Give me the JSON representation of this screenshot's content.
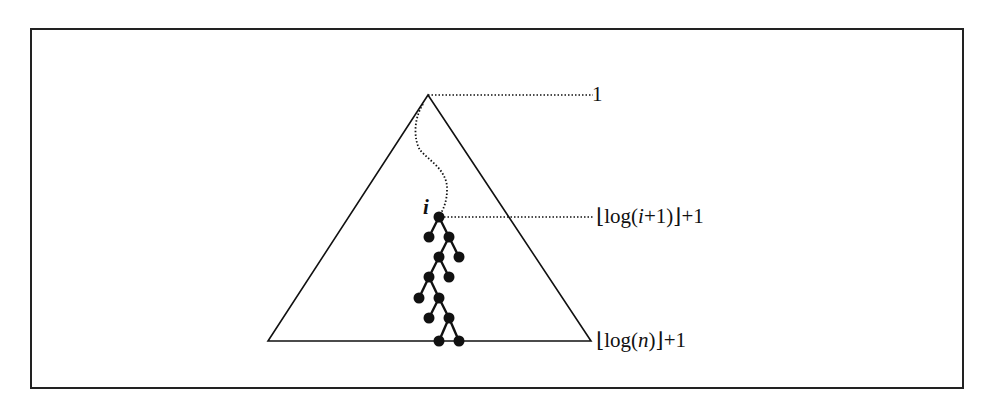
{
  "diagram": {
    "type": "binary-tree-depth-illustration",
    "frame": {
      "x": 30,
      "y": 28,
      "w": 934,
      "h": 361
    },
    "triangle": {
      "apex": [
        428,
        95
      ],
      "left": [
        268,
        341
      ],
      "right": [
        591,
        341
      ]
    },
    "node_i_label": "i",
    "levels": [
      {
        "id": "root-level",
        "label_text": "1",
        "y": 95
      },
      {
        "id": "node-i-level",
        "label_prefix": "⌊log(",
        "label_var": "i",
        "label_suffix": "+1)⌋+1",
        "y": 217
      },
      {
        "id": "bottom-level",
        "label_prefix": "⌊log(",
        "label_var": "n",
        "label_suffix": ")⌋+1",
        "y": 341
      }
    ],
    "path_from_root": "dotted curve from root down to node i",
    "subtree_nodes": [
      [
        439,
        217
      ],
      [
        429,
        237
      ],
      [
        449,
        237
      ],
      [
        439,
        257
      ],
      [
        459,
        257
      ],
      [
        429,
        277
      ],
      [
        449,
        277
      ],
      [
        419,
        298
      ],
      [
        439,
        298
      ],
      [
        429,
        318
      ],
      [
        449,
        318
      ],
      [
        439,
        341
      ],
      [
        459,
        341
      ]
    ],
    "subtree_edges": [
      [
        0,
        1
      ],
      [
        0,
        2
      ],
      [
        2,
        3
      ],
      [
        2,
        4
      ],
      [
        3,
        5
      ],
      [
        3,
        6
      ],
      [
        5,
        7
      ],
      [
        5,
        8
      ],
      [
        8,
        9
      ],
      [
        8,
        10
      ],
      [
        10,
        11
      ],
      [
        10,
        12
      ]
    ],
    "colors": {
      "ink": "#111111",
      "background": "#ffffff"
    }
  }
}
